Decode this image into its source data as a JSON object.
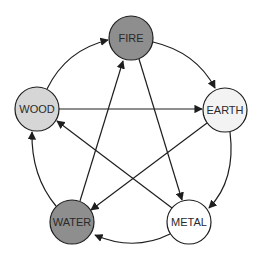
{
  "diagram": {
    "title": "",
    "nodes": [
      {
        "id": "fire",
        "label": "FIRE",
        "cx": 131,
        "cy": 38,
        "r": 22,
        "fill": "#8e8e8e"
      },
      {
        "id": "wood",
        "label": "WOOD",
        "cx": 37,
        "cy": 109,
        "r": 22,
        "fill": "#d6d6d6"
      },
      {
        "id": "earth",
        "label": "EARTH",
        "cx": 225,
        "cy": 110,
        "r": 22,
        "fill": "#f3f3f3"
      },
      {
        "id": "water",
        "label": "WATER",
        "cx": 72,
        "cy": 222,
        "r": 22,
        "fill": "#8e8e8e"
      },
      {
        "id": "metal",
        "label": "METAL",
        "cx": 189,
        "cy": 222,
        "r": 22,
        "fill": "#ffffff"
      }
    ],
    "outer_cycle_edges": [
      {
        "from": "wood",
        "to": "fire"
      },
      {
        "from": "fire",
        "to": "earth"
      },
      {
        "from": "earth",
        "to": "metal"
      },
      {
        "from": "metal",
        "to": "water"
      },
      {
        "from": "water",
        "to": "wood"
      }
    ],
    "inner_star_edges": [
      {
        "from": "wood",
        "to": "earth"
      },
      {
        "from": "earth",
        "to": "water"
      },
      {
        "from": "water",
        "to": "fire"
      },
      {
        "from": "fire",
        "to": "metal"
      },
      {
        "from": "metal",
        "to": "wood"
      }
    ],
    "colors": {
      "stroke": "#1e1e1e",
      "dark_fill": "#8e8e8e",
      "light_fill": "#d6d6d6",
      "pale_fill": "#f3f3f3",
      "white_fill": "#ffffff"
    }
  }
}
